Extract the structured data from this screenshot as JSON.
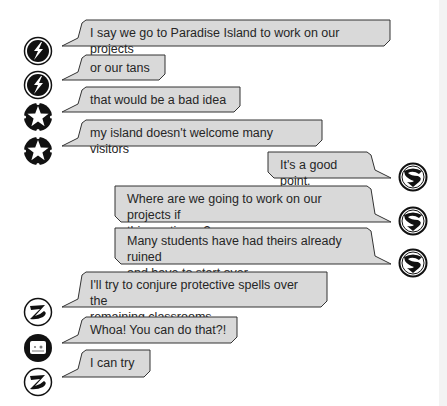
{
  "conversation": {
    "messages": [
      {
        "side": "left",
        "avatar": "lightning-bolt-icon",
        "text": "I say we go to Paradise Island to work on our projects",
        "x": 78,
        "y": 20,
        "w": 312,
        "h": 26,
        "ax": 23,
        "ay": 36
      },
      {
        "side": "left",
        "avatar": "lightning-bolt-icon",
        "text": "or our tans",
        "x": 78,
        "y": 55,
        "w": 87,
        "h": 25,
        "ax": 23,
        "ay": 70
      },
      {
        "side": "left",
        "avatar": "star-icon",
        "text": "that would be a bad idea",
        "x": 78,
        "y": 87,
        "w": 162,
        "h": 25,
        "ax": 23,
        "ay": 102
      },
      {
        "side": "left",
        "avatar": "star-icon",
        "text": "my island doesn't welcome many visitors",
        "x": 78,
        "y": 120,
        "w": 244,
        "h": 26,
        "ax": 23,
        "ay": 136
      },
      {
        "side": "right",
        "avatar": "superman-shield-icon",
        "text": "It's a good point.",
        "x": 268,
        "y": 152,
        "w": 107,
        "h": 26,
        "ax": 398,
        "ay": 162
      },
      {
        "side": "right",
        "avatar": "superman-shield-icon",
        "text": "Where are we going to work on our projects if\nthis continues?",
        "x": 115,
        "y": 186,
        "w": 260,
        "h": 36,
        "ax": 398,
        "ay": 206
      },
      {
        "side": "right",
        "avatar": "superman-shield-icon",
        "text": "Many students have had theirs already ruined\nand have to start over.",
        "x": 115,
        "y": 228,
        "w": 260,
        "h": 36,
        "ax": 398,
        "ay": 248
      },
      {
        "side": "left",
        "avatar": "zatanna-z-icon",
        "text": "I'll try to conjure protective spells over the\nremaining classrooms",
        "x": 78,
        "y": 272,
        "w": 249,
        "h": 35,
        "ax": 23,
        "ay": 297
      },
      {
        "side": "left",
        "avatar": "robot-face-icon",
        "text": "Whoa! You can do that?!",
        "x": 78,
        "y": 317,
        "w": 159,
        "h": 26,
        "ax": 23,
        "ay": 333
      },
      {
        "side": "left",
        "avatar": "zatanna-z-icon",
        "text": "I can try",
        "x": 78,
        "y": 350,
        "w": 72,
        "h": 27,
        "ax": 23,
        "ay": 367
      }
    ]
  },
  "colors": {
    "bubble_fill": "#d9d9d9",
    "bubble_stroke": "#333333",
    "avatar_dark": "#111111"
  }
}
